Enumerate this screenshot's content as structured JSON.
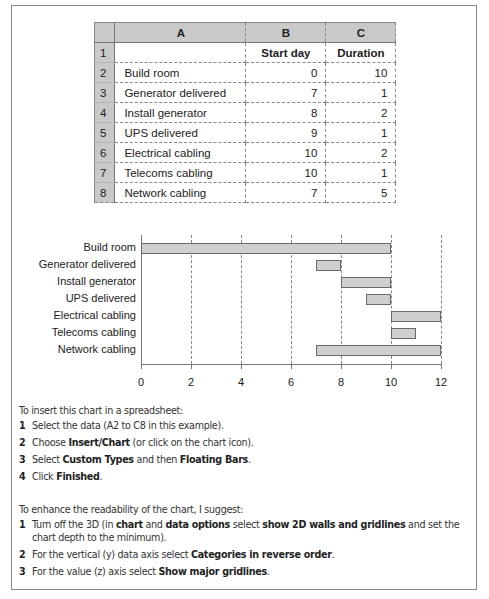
{
  "table": {
    "columns": [
      "A",
      "B",
      "C"
    ],
    "header_row": {
      "row": "1",
      "a": "",
      "b": "Start day",
      "c": "Duration"
    },
    "rows": [
      {
        "row": "2",
        "task": "Build room",
        "start": "0",
        "duration": "10"
      },
      {
        "row": "3",
        "task": "Generator delivered",
        "start": "7",
        "duration": "1"
      },
      {
        "row": "4",
        "task": "Install generator",
        "start": "8",
        "duration": "2"
      },
      {
        "row": "5",
        "task": "UPS delivered",
        "start": "9",
        "duration": "1"
      },
      {
        "row": "6",
        "task": "Electrical cabling",
        "start": "10",
        "duration": "2"
      },
      {
        "row": "7",
        "task": "Telecoms cabling",
        "start": "10",
        "duration": "1"
      },
      {
        "row": "8",
        "task": "Network cabling",
        "start": "7",
        "duration": "5"
      }
    ]
  },
  "chart_data": {
    "type": "bar",
    "orientation": "horizontal",
    "subtype": "floating-bars (Gantt)",
    "title": "",
    "xlabel": "",
    "ylabel": "",
    "categories": [
      "Build room",
      "Generator delivered",
      "Install generator",
      "UPS delivered",
      "Electrical cabling",
      "Telecoms cabling",
      "Network cabling"
    ],
    "series": [
      {
        "name": "Start day",
        "values": [
          0,
          7,
          8,
          9,
          10,
          10,
          7
        ],
        "visible": false
      },
      {
        "name": "Duration",
        "values": [
          10,
          1,
          2,
          1,
          2,
          1,
          5
        ],
        "visible": true
      }
    ],
    "x_ticks": [
      "0",
      "2",
      "4",
      "6",
      "8",
      "10",
      "12"
    ],
    "xlim": [
      0,
      12
    ],
    "grid": "vertical major gridlines (dashed)",
    "legend": "none",
    "bar_color": "#cfcfcf"
  },
  "instructions_insert": {
    "intro": "To insert this chart in a spreadsheet:",
    "steps": [
      {
        "num": "1",
        "parts": [
          {
            "t": "Select the data (A2 to C8 in this example)."
          }
        ]
      },
      {
        "num": "2",
        "parts": [
          {
            "t": "Choose "
          },
          {
            "t": "Insert/Chart",
            "b": true
          },
          {
            "t": " (or click on the chart icon)."
          }
        ]
      },
      {
        "num": "3",
        "parts": [
          {
            "t": "Select "
          },
          {
            "t": "Custom Types",
            "b": true
          },
          {
            "t": " and then "
          },
          {
            "t": "Floating Bars",
            "b": true
          },
          {
            "t": "."
          }
        ]
      },
      {
        "num": "4",
        "parts": [
          {
            "t": "Click "
          },
          {
            "t": "Finished",
            "b": true
          },
          {
            "t": "."
          }
        ]
      }
    ]
  },
  "instructions_readability": {
    "intro": "To enhance the readability of the chart, I suggest:",
    "steps": [
      {
        "num": "1",
        "parts": [
          {
            "t": "Turn off the 3D (in "
          },
          {
            "t": "chart",
            "b": true
          },
          {
            "t": " and "
          },
          {
            "t": "data options",
            "b": true
          },
          {
            "t": " select "
          },
          {
            "t": "show 2D walls and gridlines",
            "b": true
          },
          {
            "t": " and set the chart depth to the minimum)."
          }
        ]
      },
      {
        "num": "2",
        "parts": [
          {
            "t": "For the vertical (y) data axis select "
          },
          {
            "t": "Categories in reverse order",
            "b": true
          },
          {
            "t": "."
          }
        ]
      },
      {
        "num": "3",
        "parts": [
          {
            "t": "For the value (z) axis select "
          },
          {
            "t": "Show major gridlines",
            "b": true
          },
          {
            "t": "."
          }
        ]
      }
    ]
  }
}
